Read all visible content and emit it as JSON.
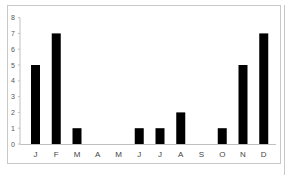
{
  "chart_data": {
    "type": "bar",
    "title": "",
    "xlabel": "",
    "ylabel": "",
    "categories": [
      "J",
      "F",
      "M",
      "A",
      "M",
      "J",
      "J",
      "A",
      "S",
      "O",
      "N",
      "D"
    ],
    "values": [
      5,
      7,
      1,
      0,
      0,
      1,
      1,
      2,
      0,
      1,
      5,
      7
    ],
    "ylim": [
      0,
      8
    ],
    "yticks": [
      0,
      1,
      2,
      3,
      4,
      5,
      6,
      7,
      8
    ],
    "grid": false,
    "legend": null,
    "bar_color": "#000000"
  }
}
